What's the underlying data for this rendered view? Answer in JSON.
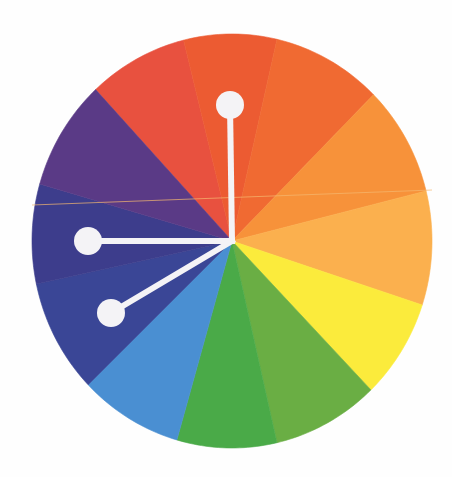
{
  "diagram": {
    "title": "Split-complementary color wheel",
    "center": [
      232,
      241
    ],
    "radius_x": 200,
    "radius_y": 207,
    "segments": [
      {
        "name": "red",
        "color": "#e8513f",
        "start_deg": 317,
        "end_deg": 346
      },
      {
        "name": "red-orange",
        "color": "#ec5b32",
        "start_deg": 346,
        "end_deg": 13
      },
      {
        "name": "orange-red",
        "color": "#f06a32",
        "start_deg": 13,
        "end_deg": 45
      },
      {
        "name": "orange",
        "color": "#f7923a",
        "start_deg": 45,
        "end_deg": 76
      },
      {
        "name": "yellow-orange",
        "color": "#fbb04e",
        "start_deg": 76,
        "end_deg": 108
      },
      {
        "name": "yellow",
        "color": "#fbeb3c",
        "start_deg": 108,
        "end_deg": 136
      },
      {
        "name": "yellow-green",
        "color": "#6aae44",
        "start_deg": 136,
        "end_deg": 167
      },
      {
        "name": "green",
        "color": "#4aaa48",
        "start_deg": 167,
        "end_deg": 196
      },
      {
        "name": "blue",
        "color": "#4a8fd2",
        "start_deg": 196,
        "end_deg": 226
      },
      {
        "name": "blue-violet",
        "color": "#3a4696",
        "start_deg": 226,
        "end_deg": 258
      },
      {
        "name": "violet",
        "color": "#3d3d8c",
        "start_deg": 258,
        "end_deg": 286
      },
      {
        "name": "purple",
        "color": "#5a3a86",
        "start_deg": 286,
        "end_deg": 317
      }
    ],
    "pointers": [
      {
        "name": "pointer-red-orange",
        "knob": [
          230,
          105
        ],
        "knob_radius": 14
      },
      {
        "name": "pointer-violet",
        "knob": [
          88,
          241
        ],
        "knob_radius": 14
      },
      {
        "name": "pointer-blue-violet",
        "knob": [
          111,
          313
        ],
        "knob_radius": 14
      }
    ],
    "pointer_color": "#f4f3f6",
    "pointer_stroke_width": 6,
    "scan_line": {
      "color": "#f5b870",
      "from": [
        32,
        205
      ],
      "to": [
        432,
        190
      ]
    }
  }
}
